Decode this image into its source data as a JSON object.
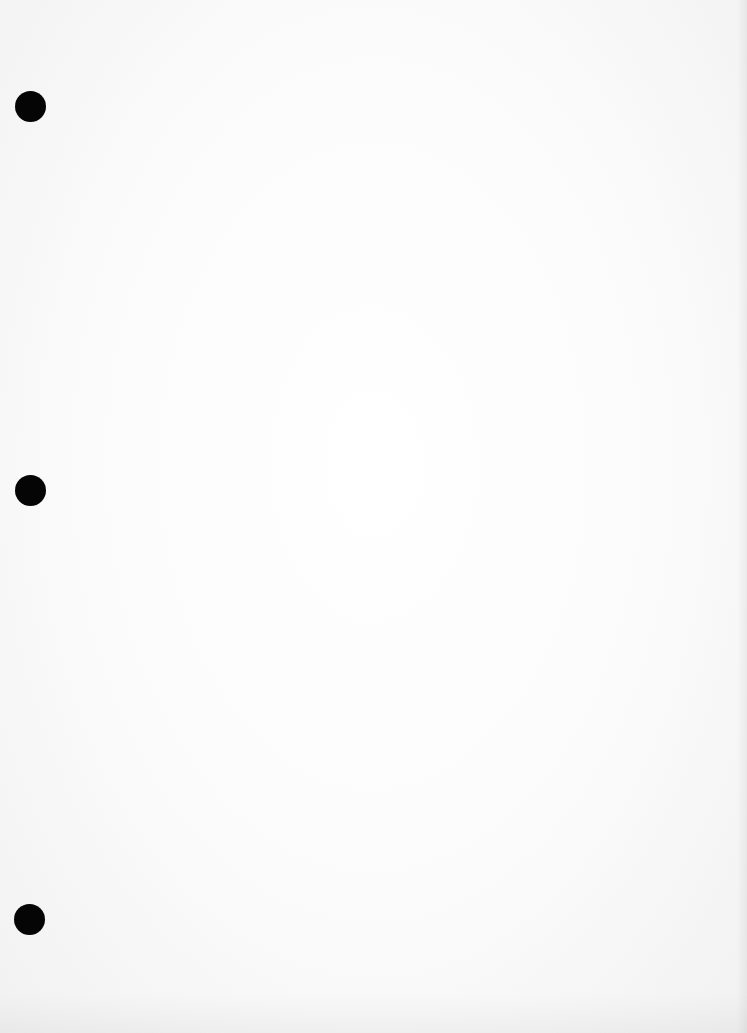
{
  "document": {
    "type": "blank-scanned-page",
    "background_color": "#ffffff",
    "text_content": "",
    "punch_holes": [
      {
        "position": "top",
        "color": "#050505"
      },
      {
        "position": "middle",
        "color": "#050505"
      },
      {
        "position": "bottom",
        "color": "#050505"
      }
    ]
  }
}
